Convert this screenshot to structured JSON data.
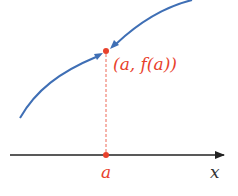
{
  "diagram": {
    "point_label": "(a, f(a))",
    "point_label_parts": {
      "open": "(",
      "a": "a",
      "comma": ",",
      "f": "f",
      "inner_open": "(",
      "inner_a": "a",
      "close": "))"
    },
    "axis_tick_label": "a",
    "axis_label": "x",
    "colors": {
      "curve": "#3f6fb5",
      "point": "#e8412c",
      "label": "#e8412c",
      "axis": "#222222",
      "dashed": "#e8412c"
    }
  }
}
